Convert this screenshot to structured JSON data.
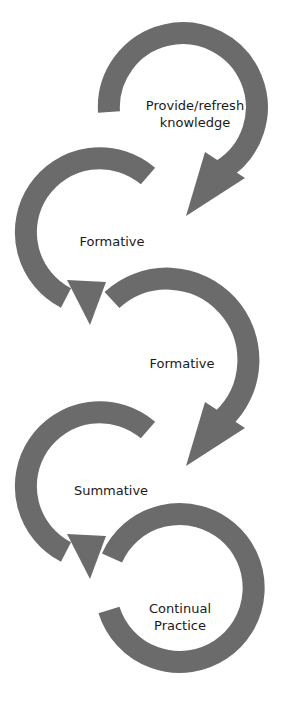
{
  "diagram": {
    "type": "cycle-chain",
    "arrow_color": "#6b6b6b",
    "background": "#ffffff",
    "stages": [
      {
        "label_line1": "Provide/refresh",
        "label_line2": "knowledge"
      },
      {
        "label_line1": "Formative",
        "label_line2": ""
      },
      {
        "label_line1": "Formative",
        "label_line2": ""
      },
      {
        "label_line1": "Summative",
        "label_line2": ""
      },
      {
        "label_line1": "Continual",
        "label_line2": "Practice"
      }
    ]
  }
}
